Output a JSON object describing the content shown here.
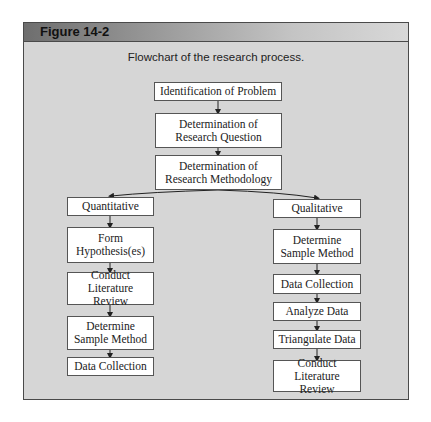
{
  "figure": {
    "label": "Figure 14-2",
    "caption": "Flowchart of the research process."
  },
  "flow": {
    "top": [
      "Identification of Problem",
      "Determination of Research Question",
      "Determination of Research Methodology"
    ],
    "quantitative": {
      "label": "Quantitative",
      "steps": [
        "Form Hypothesis(es)",
        "Conduct Literature Review",
        "Determine Sample Method",
        "Data Collection"
      ]
    },
    "qualitative": {
      "label": "Qualitative",
      "steps": [
        "Determine Sample Method",
        "Data Collection",
        "Analyze Data",
        "Triangulate Data",
        "Conduct Literature Review"
      ]
    }
  },
  "colors": {
    "panel": "#d6d6d6",
    "box": "#ffffff",
    "border": "#555555"
  }
}
